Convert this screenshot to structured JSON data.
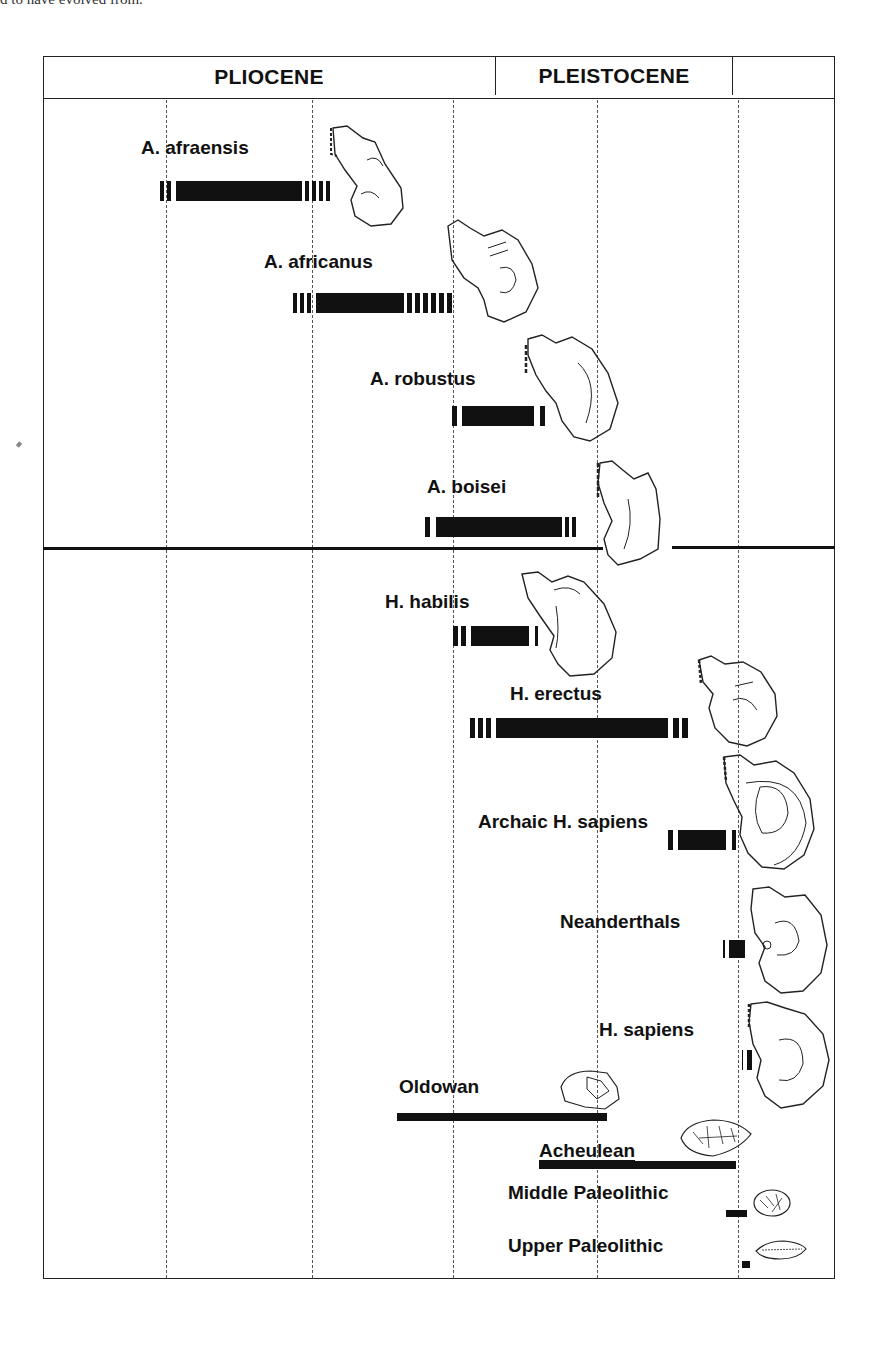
{
  "caption_fragment": "d to have evolved from.",
  "epochs": [
    {
      "label": "PLIOCENE"
    },
    {
      "label": "PLEISTOCENE"
    }
  ],
  "gridline_x": [
    166,
    310,
    451,
    595,
    737
  ],
  "sections": {
    "australopithecines": [
      "A. afraensis",
      "A. africanus",
      "A. robustus",
      "A. boisei"
    ],
    "homo": [
      "H. habilis",
      "H. erectus",
      "Archaic H. sapiens",
      "Neanderthals",
      "H. sapiens"
    ],
    "tool_industries": [
      "Oldowan",
      "Acheulean",
      "Middle Paleolithic",
      "Upper Paleolithic"
    ]
  },
  "species": [
    {
      "name": "A. afraensis",
      "bar_start_x": 160,
      "bar_end_x": 336,
      "uncertain_left_ticks": 2,
      "uncertain_right_ticks": 4
    },
    {
      "name": "A. africanus",
      "bar_start_x": 293,
      "bar_end_x": 466,
      "uncertain_left_ticks": 3,
      "uncertain_right_ticks": 6
    },
    {
      "name": "A. robustus",
      "bar_start_x": 452,
      "bar_end_x": 547,
      "uncertain_left_ticks": 1,
      "uncertain_right_ticks": 1
    },
    {
      "name": "A. boisei",
      "bar_start_x": 425,
      "bar_end_x": 583,
      "uncertain_left_ticks": 1,
      "uncertain_right_ticks": 2
    },
    {
      "name": "H. habilis",
      "bar_start_x": 453,
      "bar_end_x": 541,
      "uncertain_left_ticks": 2,
      "uncertain_right_ticks": 1
    },
    {
      "name": "H. erectus",
      "bar_start_x": 470,
      "bar_end_x": 703,
      "uncertain_left_ticks": 3,
      "uncertain_right_ticks": 2
    },
    {
      "name": "Archaic H. sapiens",
      "bar_start_x": 668,
      "bar_end_x": 734,
      "uncertain_left_ticks": 1,
      "uncertain_right_ticks": 1
    },
    {
      "name": "Neanderthals",
      "bar_start_x": 723,
      "bar_end_x": 744,
      "uncertain_left_ticks": 1,
      "uncertain_right_ticks": 0
    },
    {
      "name": "H. sapiens",
      "bar_start_x": 742,
      "bar_end_x": 749,
      "uncertain_left_ticks": 1,
      "uncertain_right_ticks": 0
    }
  ],
  "tools": [
    {
      "name": "Oldowan",
      "bar_start_x": 397,
      "bar_end_x": 607
    },
    {
      "name": "Acheulean",
      "bar_start_x": 539,
      "bar_end_x": 736
    },
    {
      "name": "Middle Paleolithic",
      "bar_start_x": 726,
      "bar_end_x": 747
    },
    {
      "name": "Upper Paleolithic",
      "bar_start_x": 742,
      "bar_end_x": 750
    }
  ],
  "icons": {
    "skull": "skull-drawing",
    "tool": "stone-tool-drawing"
  },
  "colors": {
    "ink": "#111111",
    "paper": "#ffffff",
    "gridline": "#555555"
  }
}
